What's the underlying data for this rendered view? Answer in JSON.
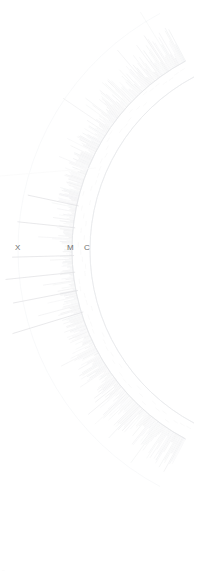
{
  "figure": {
    "kind": "circular-phylogenetic-tree",
    "background_color": "#ffffff",
    "width": 221,
    "height": 581
  },
  "chart_data": {
    "type": "tree",
    "title": "",
    "subtitle": "",
    "xlabel": "",
    "ylabel": "",
    "legend": [],
    "grid": false,
    "layout": {
      "shape": "circular",
      "center_x": 286,
      "center_y": 250,
      "inner_radius": 196,
      "leaf_base_radius": 214,
      "outer_radius": 268,
      "start_angle_deg": 118,
      "end_angle_deg": 242,
      "direction": "clockwise"
    },
    "style": {
      "branch_color": "#e9eaec",
      "leaf_color": "#dedfe2",
      "ring_color": "#f2f3f4",
      "label_color": "#6e6e6e",
      "stroke_width": 0.4
    },
    "leaf_count": 430,
    "labels": [
      {
        "text": "X",
        "x": 18,
        "y": 248,
        "angle_deg": 180.0
      },
      {
        "text": "M",
        "x": 71,
        "y": 248,
        "angle_deg": 180.0
      },
      {
        "text": "C",
        "x": 87,
        "y": 248,
        "angle_deg": 180.0
      }
    ],
    "long_branches": [
      {
        "angle_deg": 163.0,
        "length": 74
      },
      {
        "angle_deg": 169.0,
        "length": 66
      },
      {
        "angle_deg": 174.0,
        "length": 70
      },
      {
        "angle_deg": 178.5,
        "length": 62
      },
      {
        "angle_deg": 186.0,
        "length": 58
      },
      {
        "angle_deg": 192.0,
        "length": 52
      }
    ],
    "rings": [
      {
        "radius": 196,
        "color": "#f2f3f4"
      },
      {
        "radius": 214,
        "color": "#f4f5f6"
      },
      {
        "radius": 268,
        "color": "#f7f8f9"
      }
    ]
  },
  "corner": {
    "mark": "··"
  }
}
